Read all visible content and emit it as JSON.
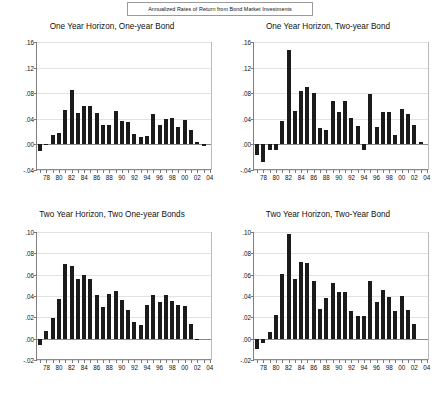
{
  "document": {
    "title": "Annualized Rates of Return from Bond Market Investments"
  },
  "chart_data": [
    {
      "type": "bar",
      "id": "one-year-horizon-one-year-bond",
      "title": "One Year Horizon, One-year Bond",
      "xlabel": "",
      "ylabel": "",
      "ylim": [
        -0.04,
        0.16
      ],
      "yticks": [
        0.16,
        0.12,
        0.08,
        0.04,
        0.0,
        -0.04
      ],
      "yticklabels": [
        ".16",
        ".12",
        ".08",
        ".04",
        ".00",
        "-.04"
      ],
      "grid": true,
      "xlim": [
        1976.5,
        2004.5
      ],
      "xticks": [
        1978,
        1980,
        1982,
        1984,
        1986,
        1988,
        1990,
        1992,
        1994,
        1996,
        1998,
        2000,
        2002,
        2004
      ],
      "xticklabels": [
        "78",
        "80",
        "82",
        "84",
        "86",
        "88",
        "90",
        "92",
        "94",
        "96",
        "98",
        "00",
        "02",
        "04"
      ],
      "x": [
        1977,
        1978,
        1979,
        1980,
        1981,
        1982,
        1983,
        1984,
        1985,
        1986,
        1987,
        1988,
        1989,
        1990,
        1991,
        1992,
        1993,
        1994,
        1995,
        1996,
        1997,
        1998,
        1999,
        2000,
        2001,
        2002,
        2003
      ],
      "values": [
        -0.011,
        -0.001,
        0.014,
        0.018,
        0.054,
        0.085,
        0.049,
        0.06,
        0.06,
        0.049,
        0.03,
        0.03,
        0.052,
        0.037,
        0.035,
        0.017,
        0.012,
        0.013,
        0.048,
        0.031,
        0.04,
        0.041,
        0.027,
        0.038,
        0.022,
        0.003,
        -0.002
      ]
    },
    {
      "type": "bar",
      "id": "one-year-horizon-two-year-bond",
      "title": "One Year Horizon, Two-year Bond",
      "xlabel": "",
      "ylabel": "",
      "ylim": [
        -0.04,
        0.16
      ],
      "yticks": [
        0.16,
        0.12,
        0.08,
        0.04,
        0.0,
        -0.04
      ],
      "yticklabels": [
        ".16",
        ".12",
        ".08",
        ".04",
        ".00",
        "-.04"
      ],
      "grid": true,
      "xlim": [
        1976.5,
        2004.5
      ],
      "xticks": [
        1978,
        1980,
        1982,
        1984,
        1986,
        1988,
        1990,
        1992,
        1994,
        1996,
        1998,
        2000,
        2002,
        2004
      ],
      "xticklabels": [
        "78",
        "80",
        "82",
        "84",
        "86",
        "88",
        "90",
        "92",
        "94",
        "96",
        "98",
        "00",
        "02",
        "04"
      ],
      "x": [
        1977,
        1978,
        1979,
        1980,
        1981,
        1982,
        1983,
        1984,
        1985,
        1986,
        1987,
        1988,
        1989,
        1990,
        1991,
        1992,
        1993,
        1994,
        1995,
        1996,
        1997,
        1998,
        1999,
        2000,
        2001,
        2002,
        2003
      ],
      "values": [
        -0.017,
        -0.027,
        -0.009,
        -0.009,
        0.037,
        0.147,
        0.052,
        0.084,
        0.09,
        0.08,
        0.026,
        0.022,
        0.068,
        0.051,
        0.068,
        0.042,
        0.029,
        -0.008,
        0.079,
        0.027,
        0.05,
        0.051,
        0.014,
        0.056,
        0.047,
        0.031,
        0.003
      ]
    },
    {
      "type": "bar",
      "id": "two-year-horizon-two-one-year-bonds",
      "title": "Two Year Horizon, Two One-year Bonds",
      "xlabel": "",
      "ylabel": "",
      "ylim": [
        -0.02,
        0.1
      ],
      "yticks": [
        0.1,
        0.08,
        0.06,
        0.04,
        0.02,
        0.0,
        -0.02
      ],
      "yticklabels": [
        ".10",
        ".08",
        ".06",
        ".04",
        ".02",
        ".00",
        "-.02"
      ],
      "grid": true,
      "xlim": [
        1976.5,
        2004.5
      ],
      "xticks": [
        1978,
        1980,
        1982,
        1984,
        1986,
        1988,
        1990,
        1992,
        1994,
        1996,
        1998,
        2000,
        2002,
        2004
      ],
      "xticklabels": [
        "78",
        "80",
        "82",
        "84",
        "86",
        "88",
        "90",
        "92",
        "94",
        "96",
        "98",
        "00",
        "02",
        "04"
      ],
      "x": [
        1977,
        1978,
        1979,
        1980,
        1981,
        1982,
        1983,
        1984,
        1985,
        1986,
        1987,
        1988,
        1989,
        1990,
        1991,
        1992,
        1993,
        1994,
        1995,
        1996,
        1997,
        1998,
        1999,
        2000,
        2001,
        2002
      ],
      "values": [
        -0.006,
        0.007,
        0.019,
        0.037,
        0.07,
        0.068,
        0.056,
        0.06,
        0.056,
        0.041,
        0.03,
        0.042,
        0.045,
        0.036,
        0.027,
        0.016,
        0.013,
        0.032,
        0.041,
        0.034,
        0.041,
        0.035,
        0.032,
        0.031,
        0.014,
        0.0
      ]
    },
    {
      "type": "bar",
      "id": "two-year-horizon-two-year-bond",
      "title": "Two Year Horizon, Two-Year Bond",
      "xlabel": "",
      "ylabel": "",
      "ylim": [
        -0.02,
        0.1
      ],
      "yticks": [
        0.1,
        0.08,
        0.06,
        0.04,
        0.02,
        0.0,
        -0.02
      ],
      "yticklabels": [
        ".10",
        ".08",
        ".06",
        ".04",
        ".02",
        ".00",
        "-.02"
      ],
      "grid": true,
      "xlim": [
        1976.5,
        2004.5
      ],
      "xticks": [
        1978,
        1980,
        1982,
        1984,
        1986,
        1988,
        1990,
        1992,
        1994,
        1996,
        1998,
        2000,
        2002,
        2004
      ],
      "xticklabels": [
        "78",
        "80",
        "82",
        "84",
        "86",
        "88",
        "90",
        "92",
        "94",
        "96",
        "98",
        "00",
        "02",
        "04"
      ],
      "x": [
        1977,
        1978,
        1979,
        1980,
        1981,
        1982,
        1983,
        1984,
        1985,
        1986,
        1987,
        1988,
        1989,
        1990,
        1991,
        1992,
        1993,
        1994,
        1995,
        1996,
        1997,
        1998,
        1999,
        2000,
        2001,
        2002
      ],
      "values": [
        -0.01,
        -0.004,
        0.006,
        0.022,
        0.061,
        0.098,
        0.056,
        0.072,
        0.071,
        0.054,
        0.028,
        0.038,
        0.052,
        0.044,
        0.044,
        0.026,
        0.021,
        0.021,
        0.054,
        0.034,
        0.046,
        0.039,
        0.026,
        0.04,
        0.027,
        0.014
      ]
    }
  ],
  "style": {
    "bar_color": "#1b1b1b",
    "grid_color": "#e2e2e2",
    "axis_color": "#8a8a8a",
    "background": "#ffffff"
  }
}
